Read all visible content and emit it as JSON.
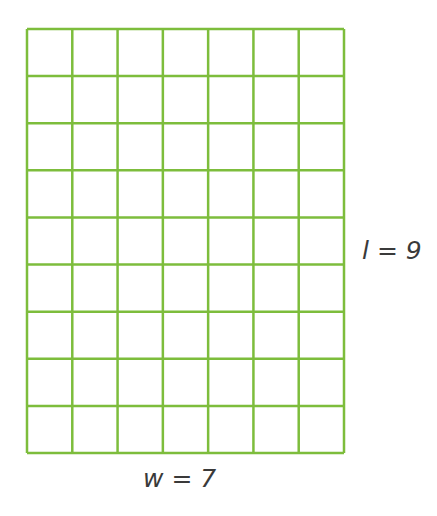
{
  "diagram": {
    "type": "rectangle-grid",
    "columns": 7,
    "rows": 9,
    "line_color": "#7dbd3c",
    "labels": {
      "length": "l = 9",
      "width": "w = 7"
    }
  }
}
